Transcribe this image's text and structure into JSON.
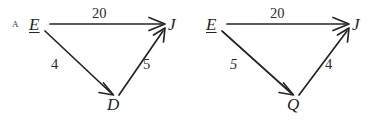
{
  "image": {
    "background_color": "#ffffff",
    "ink_color": "#242424",
    "width": 384,
    "height": 124
  },
  "figures": [
    {
      "id": "figure-a",
      "tag": "A",
      "nodes": [
        {
          "id": "E",
          "label": "E",
          "underlined": true,
          "x": 36,
          "y": 24
        },
        {
          "id": "J",
          "label": "J",
          "underlined": false,
          "x": 172,
          "y": 24
        },
        {
          "id": "D",
          "label": "D",
          "underlined": false,
          "x": 113,
          "y": 103
        }
      ],
      "edges": [
        {
          "from": "E",
          "to": "J",
          "weight": "20",
          "label_x": 99,
          "label_y": 13
        },
        {
          "from": "E",
          "to": "D",
          "weight": "4",
          "label_x": 54,
          "label_y": 63
        },
        {
          "from": "D",
          "to": "J",
          "weight": "5",
          "label_x": 145,
          "label_y": 63
        }
      ]
    },
    {
      "id": "figure-b",
      "tag": "",
      "nodes": [
        {
          "id": "E",
          "label": "E",
          "underlined": true,
          "x": 20,
          "y": 24
        },
        {
          "id": "J",
          "label": "J",
          "underlined": false,
          "x": 164,
          "y": 24
        },
        {
          "id": "Q",
          "label": "Q",
          "underlined": false,
          "x": 101,
          "y": 103
        }
      ],
      "edges": [
        {
          "from": "E",
          "to": "J",
          "weight": "20",
          "label_x": 85,
          "label_y": 13
        },
        {
          "from": "E",
          "to": "Q",
          "weight": "5",
          "label_x": 41,
          "label_y": 63
        },
        {
          "from": "Q",
          "to": "J",
          "weight": "4",
          "label_x": 135,
          "label_y": 63
        }
      ]
    }
  ]
}
